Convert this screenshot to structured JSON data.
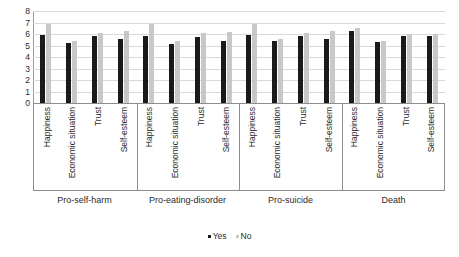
{
  "chart_data": {
    "type": "bar",
    "title": "",
    "xlabel": "",
    "ylabel": "",
    "ylim": [
      0,
      8
    ],
    "ytick_labels": [
      "8",
      "7",
      "6",
      "5",
      "4",
      "3",
      "2",
      "1",
      "0"
    ],
    "yticks": [
      8,
      7,
      6,
      5,
      4,
      3,
      2,
      1,
      0
    ],
    "grid": true,
    "legend_position": "bottom-center",
    "legend": [
      "Yes",
      "No"
    ],
    "groups": [
      "Pro-self-harm",
      "Pro-eating-disorder",
      "Pro-suicide",
      "Death"
    ],
    "categories": [
      "Happiness",
      "Economic situation",
      "Trust",
      "Self-esteem"
    ],
    "colors": {
      "yes": "#1a1a1a",
      "no": "#c8c8c8",
      "grid": "#d9d9d9",
      "axis": "#9a9a9a",
      "text": "#2b2b2b",
      "background": "#ffffff"
    },
    "series": [
      {
        "name": "Yes",
        "color": "#1a1a1a",
        "values_by_group": [
          [
            5.9,
            5.25,
            5.85,
            5.55
          ],
          [
            5.8,
            5.15,
            5.7,
            5.35
          ],
          [
            5.9,
            5.4,
            5.85,
            5.6
          ],
          [
            6.3,
            5.3,
            5.8,
            5.85
          ]
        ]
      },
      {
        "name": "No",
        "color": "#c8c8c8",
        "values_by_group": [
          [
            6.85,
            5.4,
            6.05,
            6.25
          ],
          [
            6.85,
            5.35,
            6.05,
            6.2
          ],
          [
            6.85,
            5.55,
            6.1,
            6.3
          ],
          [
            6.55,
            5.35,
            6.0,
            6.0
          ]
        ]
      }
    ]
  }
}
